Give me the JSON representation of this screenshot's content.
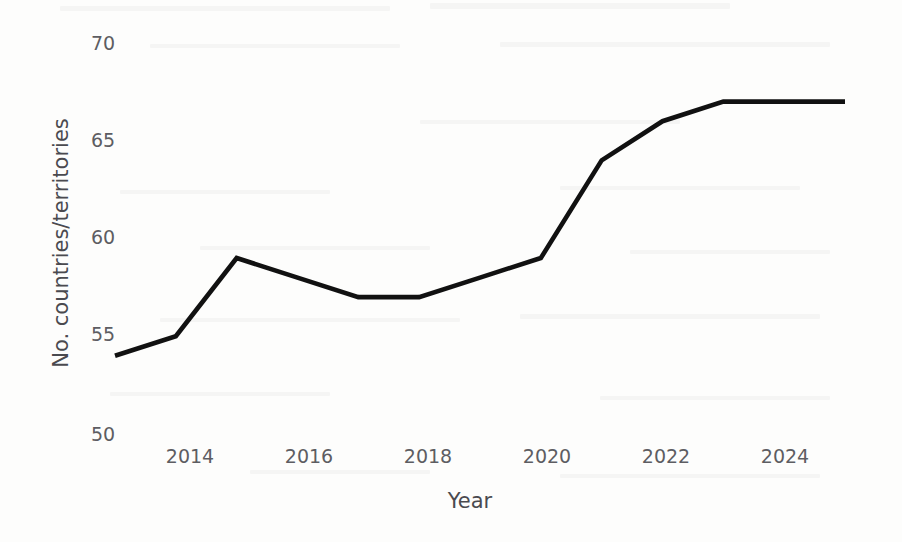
{
  "figure": {
    "background_color": "#fdfdfc",
    "line_color": "#111111",
    "text_color": "#5d5d62"
  },
  "chart_data": {
    "type": "line",
    "title": "",
    "xlabel": "Year",
    "ylabel": "No. countries/territories",
    "x": [
      2013,
      2014,
      2015,
      2016,
      2017,
      2018,
      2019,
      2020,
      2021,
      2022,
      2023,
      2024,
      2025
    ],
    "values": [
      54,
      55,
      59,
      58,
      57,
      57,
      58,
      59,
      64,
      66,
      67,
      67,
      67
    ],
    "series": [
      {
        "name": "No. countries/territories",
        "values": [
          54,
          55,
          59,
          58,
          57,
          57,
          58,
          59,
          64,
          66,
          67,
          67,
          67
        ]
      }
    ],
    "xlim": [
      2013,
      2025
    ],
    "ylim": [
      50,
      70
    ],
    "xticks": [
      2014,
      2016,
      2018,
      2020,
      2022,
      2024
    ],
    "xtick_labels": [
      "2014",
      "2016",
      "2018",
      "2020",
      "2022",
      "2024"
    ],
    "yticks": [
      50,
      55,
      60,
      65,
      70
    ],
    "ytick_labels": [
      "50",
      "55",
      "60",
      "65",
      "70"
    ],
    "grid": false,
    "legend": false,
    "legend_position": "none",
    "annotations": []
  }
}
